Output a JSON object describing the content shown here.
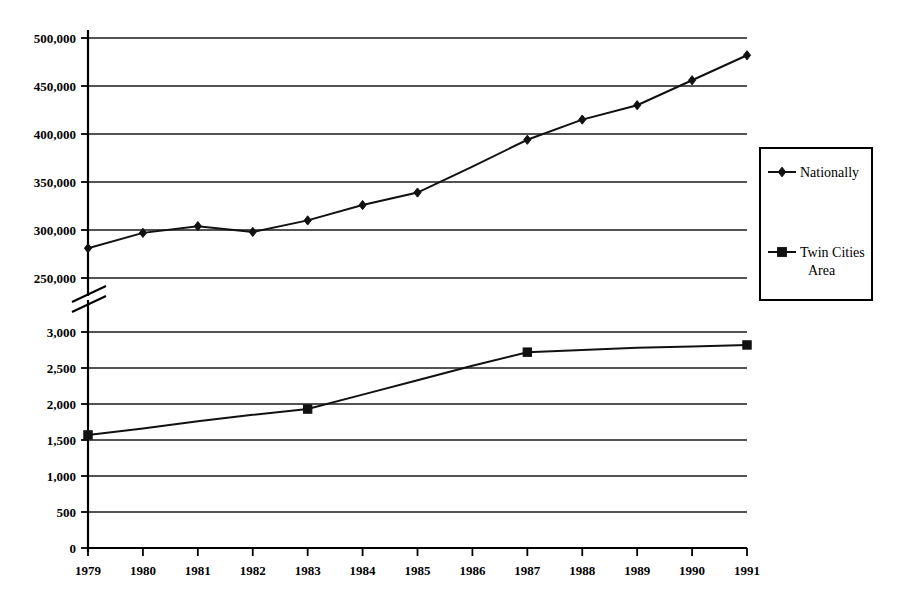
{
  "chart_data": {
    "type": "line",
    "title": "",
    "subtitle": "",
    "xlabel": "",
    "ylabel": "",
    "grid": true,
    "broken_axis": true,
    "axis_break_note": "y-axis broken between 250,000 and 3,000",
    "legend_position": "right",
    "x": [
      1979,
      1980,
      1981,
      1982,
      1983,
      1984,
      1985,
      1986,
      1987,
      1988,
      1989,
      1990,
      1991
    ],
    "x_tick_labels": [
      "1979",
      "1980",
      "1981",
      "1982",
      "1983",
      "1984",
      "1985",
      "1986",
      "1987",
      "1988",
      "1989",
      "1990",
      "1991"
    ],
    "panels": [
      {
        "name": "upper-panel",
        "series_name": "Nationally",
        "ylim": [
          250000,
          500000
        ],
        "yticks": [
          250000,
          300000,
          350000,
          400000,
          450000,
          500000
        ],
        "ytick_labels": [
          "250,000",
          "300,000",
          "350,000",
          "400,000",
          "450,000",
          "500,000"
        ]
      },
      {
        "name": "lower-panel",
        "series_name": "Twin Cities Area",
        "ylim": [
          0,
          3000
        ],
        "yticks": [
          0,
          500,
          1000,
          1500,
          2000,
          2500,
          3000
        ],
        "ytick_labels": [
          "0",
          "500",
          "1,000",
          "1,500",
          "2,000",
          "2,500",
          "3,000"
        ]
      }
    ],
    "series": [
      {
        "name": "Nationally",
        "panel": "upper-panel",
        "marker": "diamond",
        "color": "#111111",
        "values": [
          281000,
          297000,
          304000,
          298000,
          310000,
          326000,
          339000,
          366000,
          394000,
          415000,
          430000,
          456000,
          482000
        ],
        "marker_x": [
          1979,
          1980,
          1981,
          1982,
          1983,
          1984,
          1985,
          1987,
          1988,
          1989,
          1990,
          1991
        ]
      },
      {
        "name": "Twin Cities Area",
        "panel": "lower-panel",
        "marker": "square",
        "color": "#111111",
        "values": [
          1570,
          1660,
          1760,
          1850,
          1930,
          2130,
          2330,
          2530,
          2720,
          2750,
          2780,
          2800,
          2820
        ],
        "marker_x": [
          1979,
          1983,
          1987,
          1991
        ]
      }
    ],
    "legend": [
      {
        "label": "Nationally",
        "marker": "diamond",
        "color": "#111111"
      },
      {
        "label": "Twin Cities Area",
        "marker": "square",
        "color": "#111111"
      }
    ]
  },
  "legend_labels": {
    "nationally": "Nationally",
    "twin_cities_line1": "Twin Cities",
    "twin_cities_line2": "Area"
  },
  "colors": {
    "ink": "#111111",
    "background": "#ffffff"
  }
}
